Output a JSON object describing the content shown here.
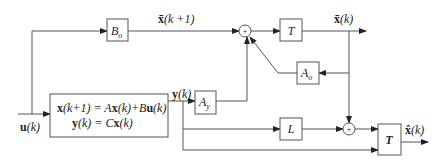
{
  "diagram": {
    "type": "block-diagram",
    "blocks": {
      "plant": {
        "line1_lhs": "x",
        "line1_arg": "(k+1) = ",
        "line1_A": "A",
        "line1_x": "x",
        "line1_k": "(k)+",
        "line1_B": "B",
        "line1_u": "u",
        "line1_end": "(k)",
        "line2_y": "y",
        "line2_mid": "(k) = ",
        "line2_C": "C",
        "line2_x": "x",
        "line2_end": "(k)"
      },
      "Bo": {
        "main": "B",
        "sub": "o"
      },
      "T_upper": {
        "label": "T"
      },
      "Ao": {
        "main": "A",
        "sub": "o"
      },
      "Ay": {
        "main": "A",
        "sub": "y"
      },
      "L": {
        "label": "L"
      },
      "T_lower": {
        "label": "T"
      },
      "sum_upper": {
        "symbol": "+"
      },
      "sum_lower": {
        "symbol": "+"
      }
    },
    "signals": {
      "input": {
        "bold": "u",
        "rest": "(k)"
      },
      "plant_output": {
        "bold": "y",
        "rest": "(k)"
      },
      "xbar_next": {
        "bold": "x̄",
        "rest": "(k +1)"
      },
      "xbar": {
        "bold": "x̄",
        "rest": "(k)"
      },
      "xhat": {
        "bold": "x̂",
        "rest": "(k)"
      }
    },
    "colors": {
      "line": "#555555",
      "text": "#222222",
      "background": "#ffffff"
    }
  }
}
